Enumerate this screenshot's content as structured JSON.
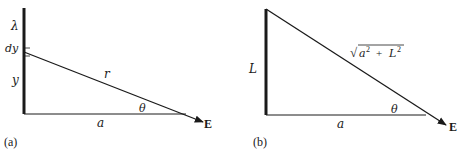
{
  "figure": {
    "panels": [
      {
        "id": "a",
        "caption": "(a)",
        "labels": {
          "line_charge": "λ",
          "element": "dy",
          "height": "y",
          "hypotenuse": "r",
          "angle": "θ",
          "base": "a",
          "field": "E"
        }
      },
      {
        "id": "b",
        "caption": "(b)",
        "labels": {
          "height": "L",
          "hypotenuse_sqrt": "√",
          "hypotenuse_a": "a",
          "hypotenuse_exp1": "2",
          "hypotenuse_plus": "+",
          "hypotenuse_L": "L",
          "hypotenuse_exp2": "2",
          "angle": "θ",
          "base": "a",
          "field": "E"
        }
      }
    ],
    "colors": {
      "ink": "#1a1a1a",
      "background": "#ffffff"
    }
  }
}
